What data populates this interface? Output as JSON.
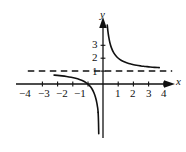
{
  "figure": {
    "kind": "cartesian-graph",
    "background_color": "#ffffff",
    "ink_color": "#111111"
  },
  "axes": {
    "x_axis_label": "x",
    "y_axis_label": "y",
    "x_tick_labels": [
      "−4",
      "−3",
      "−2",
      "−1",
      "1",
      "2",
      "3",
      "4"
    ],
    "x_tick_values": [
      -4,
      -3,
      -2,
      -1,
      1,
      2,
      3,
      4
    ],
    "y_tick_labels": [
      "1",
      "2",
      "3"
    ],
    "y_tick_values": [
      1,
      2,
      3
    ],
    "x_range": [
      -4.6,
      4.8
    ],
    "y_range": [
      -4.2,
      4.6
    ],
    "origin_px": [
      103,
      84
    ],
    "unit_px_x": 15.2,
    "unit_px_y": 12.9,
    "grid": false
  },
  "chart_data": {
    "type": "line",
    "title": "",
    "xlabel": "x",
    "ylabel": "y",
    "xlim": [
      -4.6,
      4.8
    ],
    "ylim": [
      -4.2,
      4.6
    ],
    "grid": false,
    "series": [
      {
        "name": "branch-quadrant-I",
        "style": "solid",
        "color": "#111111",
        "x": [
          0.28,
          0.32,
          0.38,
          0.45,
          0.55,
          0.7,
          0.9,
          1.1,
          1.35,
          1.6,
          1.9,
          2.2,
          2.5,
          2.8,
          3.1,
          3.4,
          3.7
        ],
        "y": [
          4.57,
          4.12,
          3.63,
          3.22,
          2.82,
          2.43,
          2.11,
          1.91,
          1.74,
          1.62,
          1.53,
          1.45,
          1.4,
          1.36,
          1.32,
          1.29,
          1.27
        ]
      },
      {
        "name": "branch-quadrant-III",
        "style": "solid",
        "color": "#111111",
        "x": [
          -3.22,
          -3.0,
          -2.7,
          -2.4,
          -2.1,
          -1.8,
          -1.55,
          -1.3,
          -1.1,
          -0.95,
          -0.82,
          -0.72,
          -0.63,
          -0.56,
          -0.5,
          -0.45,
          -0.41,
          -0.38,
          -0.355,
          -0.335,
          -0.32
        ],
        "y": [
          0.69,
          0.67,
          0.63,
          0.58,
          0.52,
          0.44,
          0.35,
          0.23,
          0.09,
          -0.05,
          -0.22,
          -0.39,
          -0.59,
          -0.79,
          -1.0,
          -1.22,
          -1.44,
          -1.63,
          -1.82,
          -2.0,
          -2.2
        ]
      },
      {
        "name": "branch-quadrant-III-tail",
        "style": "solid",
        "color": "#111111",
        "x": [
          -0.32,
          -0.305,
          -0.295,
          -0.288,
          -0.283,
          -0.28
        ],
        "y": [
          -2.2,
          -2.6,
          -3.0,
          -3.4,
          -3.7,
          -3.85
        ]
      }
    ],
    "asymptotes": [
      {
        "name": "horizontal-asymptote",
        "orientation": "horizontal",
        "value": 1,
        "style": "dashed",
        "color": "#111111",
        "x_start": -4.95,
        "x_end": 4.55
      },
      {
        "name": "vertical-asymptote",
        "orientation": "vertical",
        "value": 0,
        "style": "implied-by-axis",
        "color": "#111111"
      }
    ]
  },
  "tick_label_positions": {
    "x": [
      {
        "label": "−4",
        "left": 19,
        "top": 88
      },
      {
        "label": "−3",
        "left": 38,
        "top": 88
      },
      {
        "label": "−2",
        "left": 56,
        "top": 88
      },
      {
        "label": "−1",
        "left": 74,
        "top": 88
      },
      {
        "label": "1",
        "left": 115,
        "top": 88
      },
      {
        "label": "2",
        "left": 130,
        "top": 88
      },
      {
        "label": "3",
        "left": 146,
        "top": 88
      },
      {
        "label": "4",
        "left": 161,
        "top": 88
      }
    ],
    "y": [
      {
        "label": "3",
        "left": 92,
        "top": 39
      },
      {
        "label": "2",
        "left": 92,
        "top": 52
      },
      {
        "label": "1",
        "left": 92,
        "top": 66
      }
    ],
    "axis_names": [
      {
        "label": "y",
        "left": 100,
        "top": 9
      },
      {
        "label": "x",
        "left": 176,
        "top": 76
      }
    ]
  }
}
